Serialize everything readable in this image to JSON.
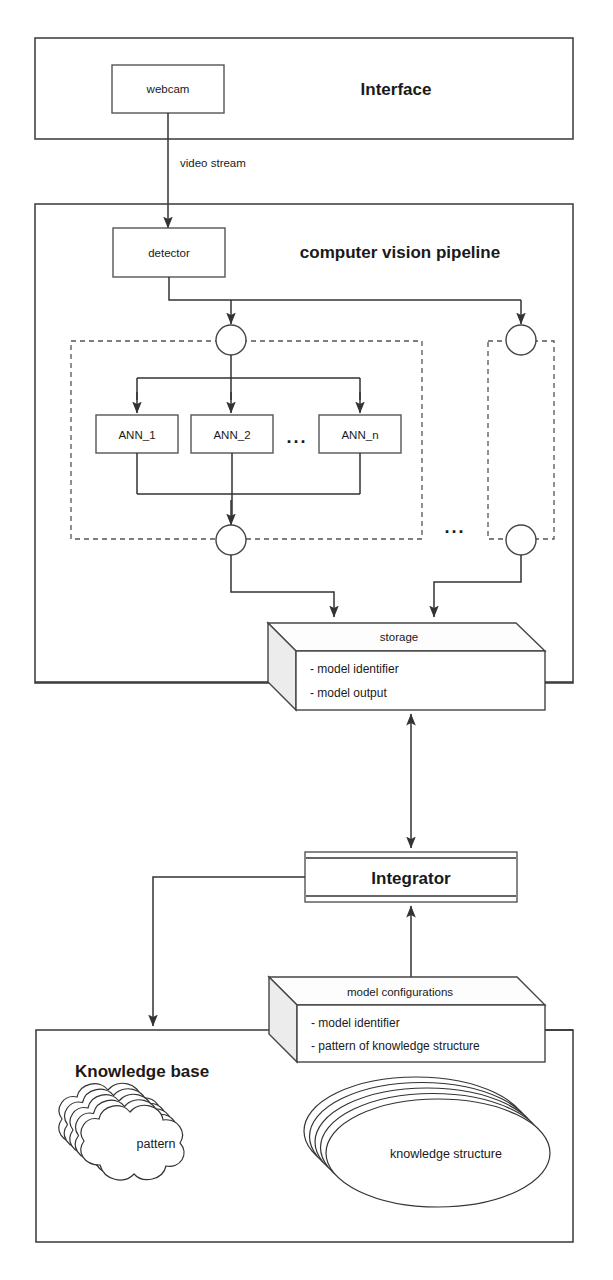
{
  "diagram": {
    "colors": {
      "background": "#ffffff",
      "stroke": "#444444",
      "text": "#1a1a1a",
      "side_face": "#ececec"
    },
    "sections": [
      {
        "id": "interface",
        "label": "Interface"
      },
      {
        "id": "pipeline",
        "label": "computer vision pipeline"
      },
      {
        "id": "knowledge_base",
        "label": "Knowledge base"
      }
    ],
    "nodes": {
      "webcam": "webcam",
      "detector": "detector",
      "ann_1": "ANN_1",
      "ann_2": "ANN_2",
      "ann_n": "ANN_n",
      "integrator": "Integrator"
    },
    "edge_labels": {
      "video_stream": "video stream"
    },
    "ellipsis": {
      "ann_inner": "...",
      "group_outer": "..."
    },
    "datastores": [
      {
        "id": "storage",
        "title": "storage",
        "items": [
          "- model identifier",
          "- model output"
        ]
      },
      {
        "id": "model_configurations",
        "title": "model configurations",
        "items": [
          "- model identifier",
          "- pattern of knowledge structure"
        ]
      }
    ],
    "knowledge_shapes": [
      {
        "id": "pattern",
        "label": "pattern",
        "shape": "cloud-stack",
        "stack_count": 5
      },
      {
        "id": "knowledge_structure",
        "label": "knowledge structure",
        "shape": "ellipse-stack",
        "stack_count": 5
      }
    ]
  }
}
